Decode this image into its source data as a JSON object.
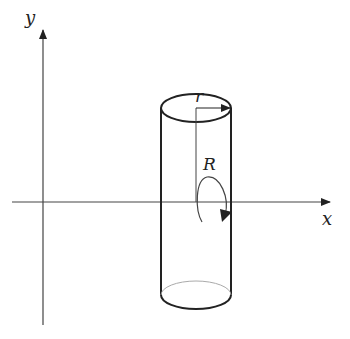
{
  "diagram": {
    "axes": {
      "x_label": "x",
      "y_label": "y"
    },
    "cylinder": {
      "radius_label": "r",
      "rotation_label": "R"
    },
    "colors": {
      "stroke": "#222222",
      "hidden_edge": "#aaaaaa",
      "background": "#ffffff"
    }
  }
}
